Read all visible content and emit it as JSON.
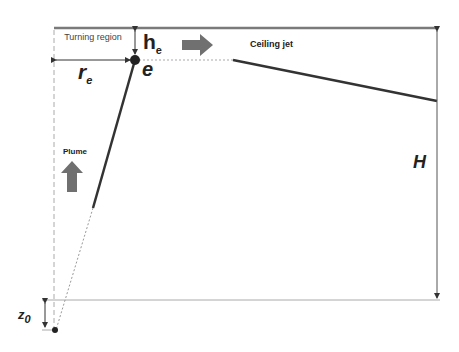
{
  "diagram": {
    "labels": {
      "turning_region": "Turning region",
      "he_main": "h",
      "he_sub": "e",
      "re_main": "r",
      "re_sub": "e",
      "e_point": "e",
      "ceiling_jet": "Ceiling jet",
      "plume": "Plume",
      "H": "H",
      "z0_main": "z",
      "z0_sub": "0"
    },
    "colors": {
      "ceiling": "#7a7a7a",
      "lines": "#333333",
      "arrows_fill": "#707070",
      "guides": "#999999"
    }
  }
}
